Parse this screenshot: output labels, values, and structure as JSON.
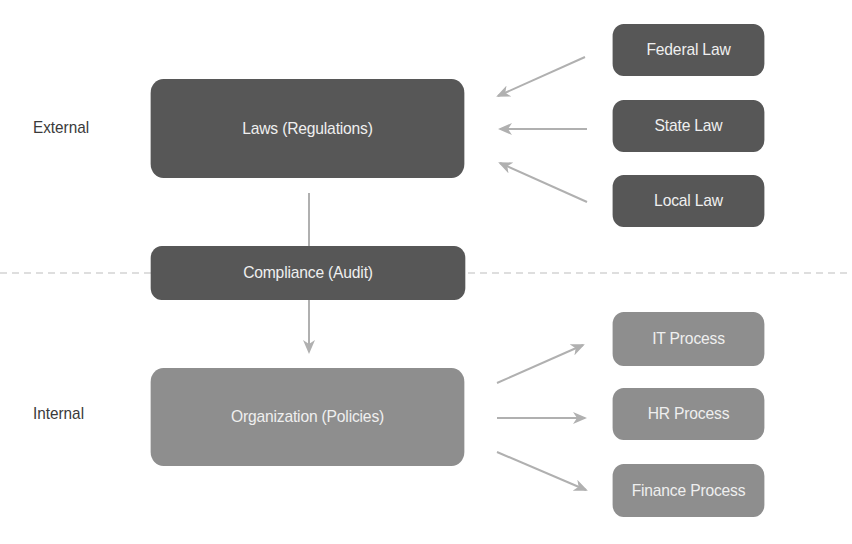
{
  "diagram": {
    "type": "flow",
    "zones": {
      "external_label": "External",
      "internal_label": "Internal"
    },
    "nodes": {
      "laws": "Laws (Regulations)",
      "compliance": "Compliance (Audit)",
      "organization": "Organization (Policies)",
      "federal": "Federal Law",
      "state": "State Law",
      "local": "Local Law",
      "it": "IT Process",
      "hr": "HR Process",
      "finance": "Finance Process"
    },
    "edges": [
      {
        "from": "Federal Law",
        "to": "Laws (Regulations)"
      },
      {
        "from": "State Law",
        "to": "Laws (Regulations)"
      },
      {
        "from": "Local Law",
        "to": "Laws (Regulations)"
      },
      {
        "from": "Laws (Regulations)",
        "to": "Compliance (Audit)"
      },
      {
        "from": "Compliance (Audit)",
        "to": "Organization (Policies)"
      },
      {
        "from": "Organization (Policies)",
        "to": "IT Process"
      },
      {
        "from": "Organization (Policies)",
        "to": "HR Process"
      },
      {
        "from": "Organization (Policies)",
        "to": "Finance Process"
      }
    ],
    "colors": {
      "external_box": "#575757",
      "internal_box": "#8e8e8e",
      "arrow": "#b0b0b0",
      "divider": "#bdbdbd",
      "box_text": "#efefef",
      "label_text": "#3a3a3a"
    }
  }
}
